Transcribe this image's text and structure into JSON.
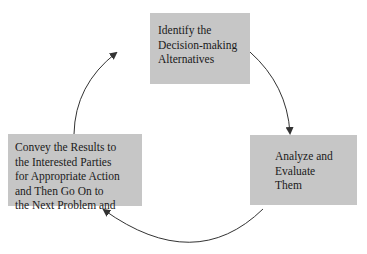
{
  "diagram": {
    "type": "cycle",
    "nodes": [
      {
        "id": "identify",
        "lines": [
          "Identify the",
          "Decision-making",
          "Alternatives"
        ]
      },
      {
        "id": "analyze",
        "lines": [
          "Analyze and",
          "Evaluate",
          "Them"
        ]
      },
      {
        "id": "convey",
        "lines": [
          "Convey the Results to",
          "the Interested Parties",
          "for Appropriate Action",
          "and Then Go On to",
          "the Next Problem and"
        ]
      }
    ],
    "edges": [
      {
        "from": "identify",
        "to": "analyze"
      },
      {
        "from": "analyze",
        "to": "convey"
      },
      {
        "from": "convey",
        "to": "identify"
      }
    ],
    "colors": {
      "box_fill": "#c6c6c6",
      "arrow": "#333333",
      "text": "#1a1a1a"
    }
  }
}
